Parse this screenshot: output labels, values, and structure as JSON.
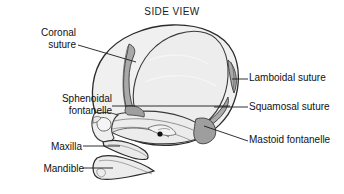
{
  "figure": {
    "title": "SIDE VIEW"
  },
  "colors": {
    "background": "#ffffff",
    "bone_fill": "#f0f0f0",
    "bone_fill_shaded": "#e6e6e6",
    "suture_fill": "#a9a9a9",
    "fontanelle_fill": "#9e9e9e",
    "outline": "#2b2b2b",
    "inner_line": "#555555",
    "leader_line": "#1a1a1a",
    "text": "#111111"
  },
  "labels": {
    "coronal_suture": "Coronal\nsuture",
    "sphenoidal_fontanelle": "Sphenoidal\nfontanelle",
    "maxilla": "Maxilla",
    "mandible": "Mandible",
    "lamboidal_suture": "Lamboidal suture",
    "squamosal_suture": "Squamosal suture",
    "mastoid_fontanelle": "Mastoid fontanelle"
  },
  "callouts": [
    {
      "id": "coronal-suture",
      "text": "Coronal suture",
      "side": "left",
      "leader": "diagonal"
    },
    {
      "id": "sphenoidal-fontanelle",
      "text": "Sphenoidal fontanelle",
      "side": "left",
      "leader": "horizontal"
    },
    {
      "id": "maxilla",
      "text": "Maxilla",
      "side": "left",
      "leader": "horizontal"
    },
    {
      "id": "mandible",
      "text": "Mandible",
      "side": "left",
      "leader": "horizontal"
    },
    {
      "id": "lamboidal-suture",
      "text": "Lamboidal suture",
      "side": "right",
      "leader": "horizontal"
    },
    {
      "id": "squamosal-suture",
      "text": "Squamosal suture",
      "side": "right",
      "leader": "horizontal"
    },
    {
      "id": "mastoid-fontanelle",
      "text": "Mastoid fontanelle",
      "side": "right",
      "leader": "diagonal"
    }
  ],
  "anatomy_parts": [
    "cranial-vault",
    "frontal-bone",
    "parietal-bone",
    "occipital-bone",
    "coronal-suture-band",
    "squamosal-suture-band",
    "lamboidal-suture-band",
    "sphenoidal-fontanelle-patch",
    "mastoid-fontanelle-patch",
    "temporal-bone",
    "orbit",
    "nasal-bone",
    "maxilla-bone",
    "mandible-bone",
    "foramen"
  ]
}
